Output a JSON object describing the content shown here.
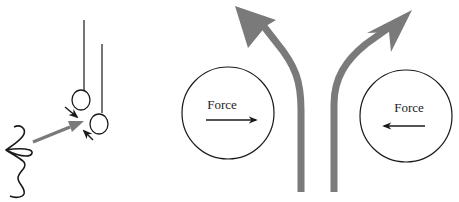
{
  "diagram": {
    "colors": {
      "line": "#1a1a1a",
      "stream": "#7a7a7a",
      "background": "#ffffff"
    },
    "left_panel": {
      "elements": [
        "mouth-profile",
        "air-blow-arrow",
        "hanging-ball-1",
        "hanging-ball-2",
        "force-arrow-1",
        "force-arrow-2"
      ]
    },
    "right_panel": {
      "circles": [
        {
          "label": "Force",
          "force_direction": "right"
        },
        {
          "label": "Force",
          "force_direction": "left"
        }
      ],
      "streams": [
        {
          "name": "left-stream",
          "direction": "up-left"
        },
        {
          "name": "right-stream",
          "direction": "up-right"
        }
      ]
    }
  }
}
